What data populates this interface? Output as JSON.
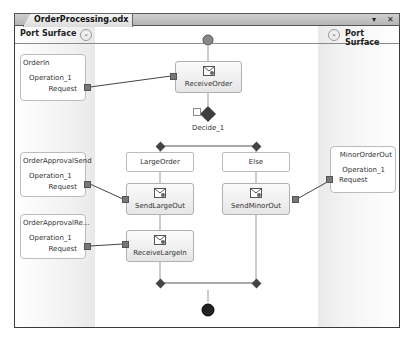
{
  "window": {
    "tab_title": "OrderProcessing.odx",
    "controls": {
      "dropdown": "▾",
      "close": "✕"
    }
  },
  "port_surface": {
    "left": {
      "title": "Port Surface",
      "collapse_icon": "«"
    },
    "right": {
      "title": "Port Surface",
      "collapse_icon": "»"
    }
  },
  "ports": {
    "order_in": {
      "name": "OrderIn",
      "operation": "Operation_1",
      "message": "Request"
    },
    "order_approval_send": {
      "name": "OrderApprovalSend",
      "operation": "Operation_1",
      "message": "Request"
    },
    "order_approval_receive": {
      "name": "OrderApprovalRe...",
      "operation": "Operation_1",
      "message": "Request"
    },
    "minor_order_out": {
      "name": "MinorOrderOut",
      "operation": "Operation_1",
      "message": "Request"
    }
  },
  "shapes": {
    "receive_order": {
      "label": "ReceiveOrder",
      "type": "receive"
    },
    "decide": {
      "label": "Decide_1",
      "type": "decide"
    },
    "branch_large": {
      "label": "LargeOrder"
    },
    "branch_else": {
      "label": "Else"
    },
    "send_large_out": {
      "label": "SendLargeOut",
      "type": "send"
    },
    "send_minor_out": {
      "label": "SendMinorOut",
      "type": "send"
    },
    "receive_large_in": {
      "label": "ReceiveLargeIn",
      "type": "receive"
    }
  },
  "colors": {
    "frame": "#3a3a3a",
    "shape_border": "#b0b0b0",
    "connector": "#777777",
    "diamond": "#444444"
  }
}
